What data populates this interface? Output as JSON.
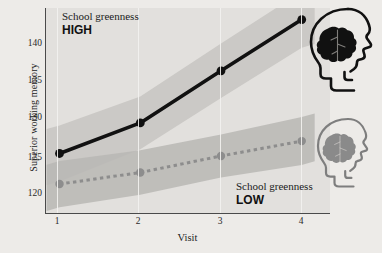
{
  "figure": {
    "background_color": "#edebe8",
    "plot_background_color": "#e2e0dd"
  },
  "annotations": {
    "high": {
      "title": "School greenness",
      "value": "HIGH",
      "icon": "head-brain-dark-icon"
    },
    "low": {
      "title": "School greenness",
      "value": "LOW",
      "icon": "head-brain-gray-icon"
    }
  },
  "chart_data": {
    "type": "line",
    "title": "",
    "subtitle": "",
    "xlabel": "Visit",
    "ylabel": "Superior working memory",
    "x": [
      1,
      2,
      3,
      4
    ],
    "xtick_labels": [
      "1",
      "2",
      "3",
      "4"
    ],
    "ytick_labels": [
      "120",
      "125",
      "130",
      "135",
      "140"
    ],
    "yticks": [
      120,
      125,
      130,
      135,
      140
    ],
    "xlim": [
      0.82,
      4.35
    ],
    "ylim": [
      117.8,
      142.6
    ],
    "grid": "vertical-only",
    "legend": "annotations-in-plot",
    "series": [
      {
        "name": "School greenness HIGH",
        "label": "HIGH",
        "style": "solid",
        "color": "#111111",
        "marker": "circle",
        "values": [
          125.0,
          128.7,
          135.0,
          141.2
        ],
        "ci_lower": [
          121.6,
          125.5,
          131.7,
          137.8
        ],
        "ci_upper": [
          128.4,
          131.9,
          138.3,
          144.6
        ]
      },
      {
        "name": "School greenness LOW",
        "label": "LOW",
        "style": "dashed",
        "color": "#8d8d8d",
        "marker": "circle",
        "values": [
          121.3,
          122.7,
          124.7,
          126.5
        ],
        "ci_lower": [
          118.5,
          120.0,
          122.1,
          123.6
        ],
        "ci_upper": [
          124.1,
          125.4,
          127.3,
          129.4
        ]
      }
    ],
    "band_color_high": "#c9c7c4",
    "band_color_low": "#b9b7b4"
  }
}
